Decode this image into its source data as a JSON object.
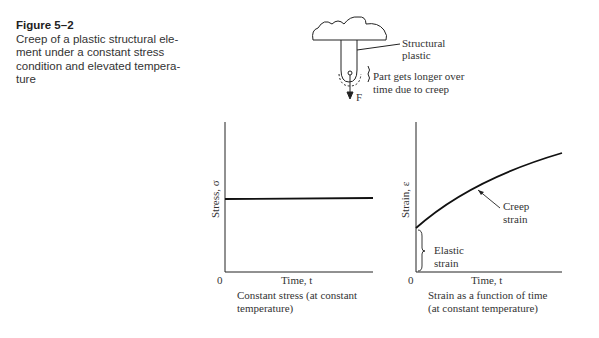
{
  "caption": {
    "figure_label": "Figure 5–2",
    "lines": [
      "Creep of a plastic structural ele-",
      "ment under a constant stress",
      "condition and elevated tempera-",
      "ture"
    ]
  },
  "sketch": {
    "label_material_1": "Structural",
    "label_material_2": "plastic",
    "label_creep_1": "Part gets longer over",
    "label_creep_2": "time due to creep",
    "force_label": "F"
  },
  "stress_plot": {
    "ylabel": "Stress, σ",
    "xlabel": "Time, t",
    "origin": "0",
    "caption_1": "Constant stress (at constant",
    "caption_2": "temperature)"
  },
  "strain_plot": {
    "ylabel": "Strain, ε",
    "xlabel": "Time, t",
    "origin": "0",
    "creep_1": "Creep",
    "creep_2": "strain",
    "elastic_1": "Elastic",
    "elastic_2": "strain",
    "caption_1": "Strain as a function of time",
    "caption_2": "(at constant temperature)"
  },
  "colors": {
    "line": "#222222",
    "text": "#333333"
  }
}
